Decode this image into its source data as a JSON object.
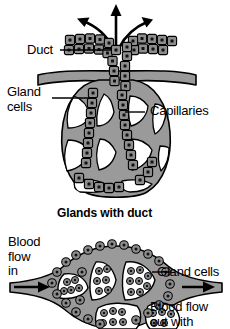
{
  "figure": {
    "colors": {
      "tissue_gray": "#9a9a9a",
      "cell_gray": "#8d8d8d",
      "lumen_white": "#ffffff",
      "outline_black": "#000000",
      "background": "#ffffff"
    }
  },
  "panels": {
    "top": {
      "caption": "Glands with duct",
      "labels": {
        "duct": "Duct",
        "gland_cells_line1": "Gland",
        "gland_cells_line2": "cells",
        "capillaries": "Capillaries"
      },
      "secretion_arrows": 3
    },
    "bottom": {
      "labels": {
        "blood_flow_in_line1": "Blood",
        "blood_flow_in_line2": "flow",
        "blood_flow_in_line3": "in",
        "gland_cells": "Gland cells",
        "blood_flow_out_line1": "Blood flow",
        "blood_flow_out_line2": "out with"
      },
      "flow_arrows": 2,
      "compartments": 5
    }
  },
  "icons": {
    "secretion_arrow": "arrow-icon",
    "blood_flow_arrow": "arrow-icon",
    "leader_line": "leader-line"
  }
}
